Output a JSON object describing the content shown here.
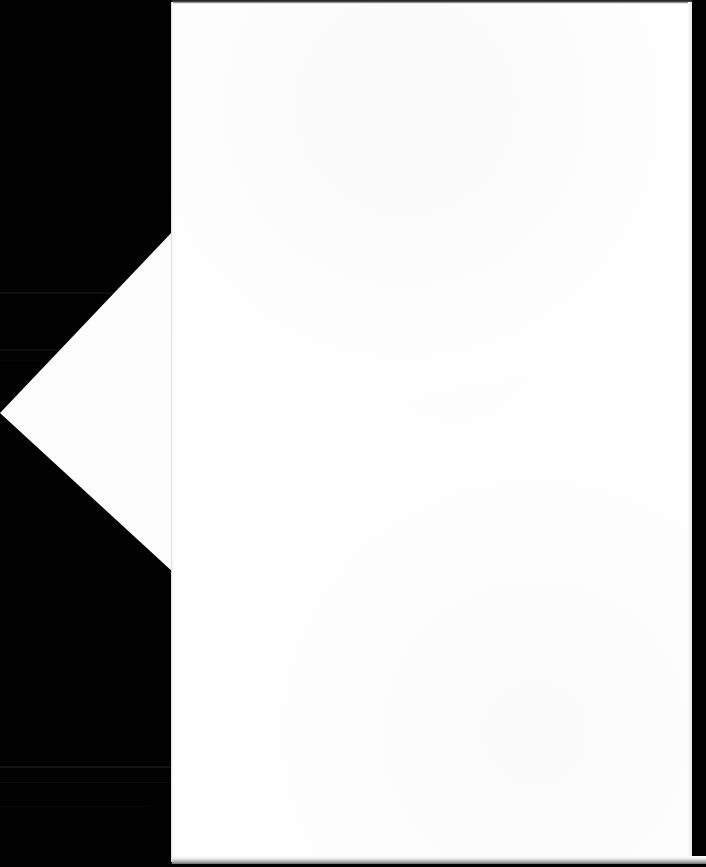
{
  "document": {
    "kind": "scanned-page-photograph",
    "page_text": "",
    "background_color": "#010101",
    "paper_color": "#ffffff",
    "flap_color": "#fdfdfd",
    "edge_color": "#6d6d6d",
    "canvas": {
      "width": 706,
      "height": 867
    },
    "sheet": {
      "left": 172,
      "top": 2,
      "right": 691,
      "bottom": 862,
      "width": 519,
      "height": 860
    },
    "flap": {
      "apex_x": 0,
      "apex_y": 413,
      "top_vertex_x": 173,
      "top_vertex_y": 230,
      "bottom_vertex_x": 173,
      "bottom_vertex_y": 572
    },
    "scan_bands": [
      {
        "top": 292,
        "height": 2,
        "opacity": 0.055
      },
      {
        "top": 349,
        "height": 2,
        "opacity": 0.05
      },
      {
        "top": 360,
        "height": 1,
        "opacity": 0.035
      },
      {
        "top": 766,
        "height": 2,
        "opacity": 0.07
      },
      {
        "top": 782,
        "height": 1,
        "opacity": 0.045
      },
      {
        "top": 806,
        "height": 1,
        "opacity": 0.03
      }
    ]
  }
}
